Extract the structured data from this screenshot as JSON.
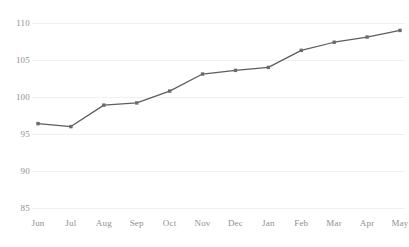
{
  "chart_data": {
    "type": "line",
    "title": "",
    "subtitle": "",
    "xlabel": "",
    "ylabel": "",
    "categories": [
      "Jun",
      "Jul",
      "Aug",
      "Sep",
      "Oct",
      "Nov",
      "Dec",
      "Jan",
      "Feb",
      "Mar",
      "Apr",
      "May"
    ],
    "values": [
      96.4,
      96.0,
      98.9,
      99.2,
      100.8,
      103.1,
      103.6,
      104.0,
      106.3,
      107.4,
      108.1,
      109.0
    ],
    "series": [
      {
        "name": "",
        "values": [
          96.4,
          96.0,
          98.9,
          99.2,
          100.8,
          103.1,
          103.6,
          104.0,
          106.3,
          107.4,
          108.1,
          109.0
        ]
      }
    ],
    "ylim": [
      85,
      110
    ],
    "yticks": [
      85,
      90,
      95,
      100,
      105,
      110
    ],
    "ytick_labels": [
      "85",
      "90",
      "95",
      "100",
      "105",
      "110"
    ],
    "xtick_labels": [
      "Jun",
      "Jul",
      "Aug",
      "Sep",
      "Oct",
      "Nov",
      "Dec",
      "Jan",
      "Feb",
      "Mar",
      "Apr",
      "May"
    ],
    "grid": true,
    "grid_axis": "y",
    "legend": false,
    "legend_position": "none",
    "markers": true,
    "marker_shape": "square",
    "annotations": []
  },
  "style": {
    "line_color": "#5d5d5d",
    "marker_color": "#6b6b6b",
    "grid_color": "#f0f0f0",
    "axis_text_color": "#909090",
    "background_color": "#ffffff"
  }
}
